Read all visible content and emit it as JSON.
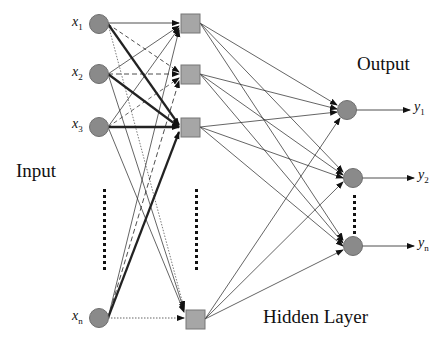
{
  "labels": {
    "input": "Input",
    "output": "Output",
    "hidden": "Hidden Layer"
  },
  "inputs": [
    {
      "name": "x",
      "sub": "1"
    },
    {
      "name": "x",
      "sub": "2"
    },
    {
      "name": "x",
      "sub": "3"
    },
    {
      "name": "x",
      "sub": "n"
    }
  ],
  "outputs": [
    {
      "name": "y",
      "sub": "1"
    },
    {
      "name": "y",
      "sub": "2"
    },
    {
      "name": "y",
      "sub": "n"
    }
  ],
  "colors": {
    "node_fill": "#8a8a8a",
    "node_stroke": "#6e6e6e",
    "hidden_fill": "#a6a6a6",
    "line": "#222222"
  }
}
